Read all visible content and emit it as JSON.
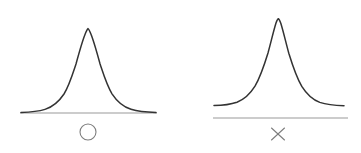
{
  "figure": {
    "background_color": "#ffffff",
    "width": 361,
    "height": 153,
    "curve_color": "#333333",
    "axis_color": "#999999",
    "marker_color": "#7d7d7d"
  },
  "panels": [
    {
      "id": "left",
      "name": "bell-curve-panel-accepted",
      "marker_label": "○",
      "marker_name": "circle-marker",
      "marker_meaning": "circle",
      "axis_label": "",
      "peak_x": 88,
      "peak_y": 28,
      "axis_y": 113,
      "axis_x_start": 20,
      "axis_x_end": 157,
      "marker_center_x": 88,
      "marker_center_y": 132,
      "tails_touch_axis": true
    },
    {
      "id": "right",
      "name": "bell-curve-panel-rejected",
      "marker_label": "×",
      "marker_name": "cross-marker",
      "marker_meaning": "cross",
      "axis_label": "",
      "peak_x": 98,
      "peak_y": 19,
      "axis_y": 118,
      "axis_x_start": 33,
      "axis_x_end": 168,
      "marker_center_x": 98,
      "marker_center_y": 134,
      "tails_touch_axis": false
    }
  ],
  "chart_data": {
    "type": "line",
    "title": "",
    "subtitle": "",
    "xlabel": "",
    "ylabel": "",
    "grid": false,
    "legend": "none",
    "charts": [
      {
        "panel": "left",
        "series_name": "normal-distribution-left",
        "annotation": "○",
        "distribution": "normal",
        "mean": 0,
        "sd": 1,
        "x": [
          -3.0,
          -2.5,
          -2.0,
          -1.5,
          -1.0,
          -0.5,
          0.0,
          0.5,
          1.0,
          1.5,
          2.0,
          2.5,
          3.0
        ],
        "y": [
          0.0044,
          0.0175,
          0.054,
          0.1295,
          0.242,
          0.3521,
          0.3989,
          0.3521,
          0.242,
          0.1295,
          0.054,
          0.0175,
          0.0044
        ],
        "xlim": [
          -3.0,
          3.0
        ],
        "ylim": [
          0,
          0.42
        ],
        "peak_height_ratio": 1.0,
        "tails_meet_axis": true
      },
      {
        "panel": "right",
        "series_name": "normal-distribution-right",
        "annotation": "×",
        "distribution": "normal",
        "mean": 0,
        "sd": 0.92,
        "x": [
          -3.0,
          -2.5,
          -2.0,
          -1.5,
          -1.0,
          -0.5,
          0.0,
          0.5,
          1.0,
          1.5,
          2.0,
          2.5,
          3.0
        ],
        "y": [
          0.0025,
          0.0118,
          0.0427,
          0.1175,
          0.2467,
          0.395,
          0.4336,
          0.395,
          0.2467,
          0.1175,
          0.0427,
          0.0118,
          0.0025
        ],
        "xlim": [
          -3.0,
          3.0
        ],
        "ylim": [
          0,
          0.45
        ],
        "peak_height_ratio": 1.09,
        "tails_meet_axis": false
      }
    ]
  }
}
